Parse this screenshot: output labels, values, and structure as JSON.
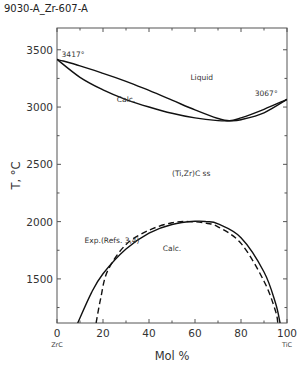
{
  "figure_id": "9030-A_Zr-607-A",
  "chart_data": {
    "type": "line",
    "title": "",
    "xlabel": "Mol %",
    "ylabel": "T, °C",
    "xlim": [
      0,
      100
    ],
    "ylim": [
      1115,
      3690
    ],
    "x_ticks": [
      0,
      20,
      40,
      60,
      80,
      100
    ],
    "x_minor_ticks": [
      10,
      30,
      50,
      70,
      90
    ],
    "y_ticks": [
      1500,
      2000,
      2500,
      3000,
      3500
    ],
    "y_minor_ticks": [
      1250,
      1750,
      2250,
      2750,
      3250
    ],
    "x_endpoint_labels": {
      "left": "ZrC",
      "right": "TiC"
    },
    "grid": false,
    "series": [
      {
        "name": "Liquidus (Calc.)",
        "style": "solid",
        "x": [
          0,
          10,
          20,
          30,
          40,
          50,
          60,
          70,
          75,
          80,
          90,
          100
        ],
        "y": [
          3417,
          3360,
          3295,
          3225,
          3145,
          3060,
          2975,
          2900,
          2880,
          2905,
          2980,
          3067
        ]
      },
      {
        "name": "Solidus (Calc.)",
        "style": "solid",
        "x": [
          0,
          10,
          20,
          30,
          40,
          50,
          60,
          70,
          75,
          80,
          90,
          100
        ],
        "y": [
          3417,
          3260,
          3150,
          3065,
          3000,
          2945,
          2905,
          2882,
          2880,
          2890,
          2950,
          3067
        ]
      },
      {
        "name": "Miscibility gap (Calc.)",
        "style": "solid",
        "x": [
          9,
          15,
          20,
          30,
          40,
          50,
          60,
          65,
          70,
          80,
          90,
          95,
          97
        ],
        "y": [
          1115,
          1380,
          1545,
          1760,
          1900,
          1975,
          2003,
          2000,
          1980,
          1860,
          1560,
          1290,
          1115
        ]
      },
      {
        "name": "Exp.(Refs. 3,4)",
        "style": "dashed",
        "x": [
          17,
          19,
          22,
          30,
          40,
          50,
          58,
          65,
          70,
          80,
          90,
          95,
          96
        ],
        "y": [
          1115,
          1330,
          1570,
          1800,
          1925,
          1990,
          2000,
          1985,
          1955,
          1810,
          1480,
          1220,
          1115
        ]
      }
    ],
    "annotations": [
      {
        "text": "3417°",
        "x": 2,
        "y": 3440
      },
      {
        "text": "Liquid",
        "x": 58,
        "y": 3240
      },
      {
        "text": "3067°",
        "x": 86,
        "y": 3100
      },
      {
        "text": "Calc.",
        "x": 26,
        "y": 3040
      },
      {
        "text": "(Ti,Zr)C ss",
        "x": 50,
        "y": 2395
      },
      {
        "text": "Exp.(Refs. 3,4)",
        "x": 12,
        "y": 1815
      },
      {
        "text": "Calc.",
        "x": 46,
        "y": 1740
      }
    ]
  }
}
